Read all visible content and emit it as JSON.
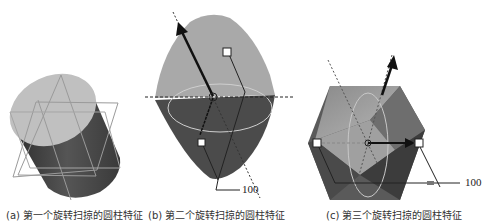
{
  "figure": {
    "panels": [
      {
        "id": "a",
        "caption": "(a) 第一个旋转扫掠的圆柱特征",
        "shape": "cylinder",
        "colors": {
          "top": "#bdbdbd",
          "side": "#3a3a3a",
          "outline": "#9a9a9a"
        }
      },
      {
        "id": "b",
        "caption": "(b) 第二个旋转扫掠的圆柱特征",
        "shape": "double-cone",
        "dimension_label": "100",
        "colors": {
          "upper": "#a8a8a8",
          "lower": "#4a4a4a",
          "arrow": "#111111"
        }
      },
      {
        "id": "c",
        "caption": "(c) 第三个旋转扫掠的圆柱特征",
        "shape": "faceted-hexagonal-solid",
        "dimension_label": "100",
        "inner_label": "距离 1",
        "colors": {
          "light": "#9c9c9c",
          "dark": "#3c3c3c",
          "arrow": "#111111"
        }
      }
    ]
  }
}
